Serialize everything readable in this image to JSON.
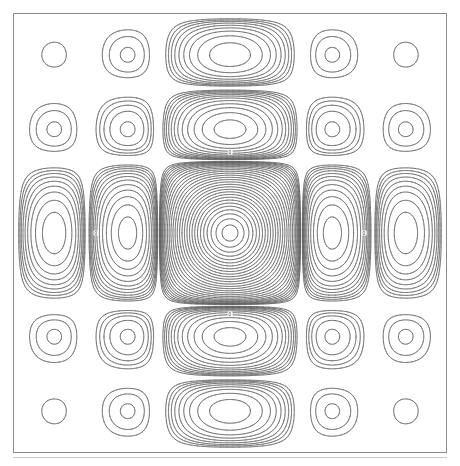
{
  "figure": {
    "title": "",
    "background_color": "#ffffff",
    "frame_color": "#8a8a8a",
    "line_color": "#555555",
    "frame": {
      "x": 13,
      "y": 13,
      "width": 434,
      "height": 440
    }
  },
  "chart_data": {
    "type": "contour",
    "title": "",
    "subtitle": "",
    "xlabel": "",
    "ylabel": "",
    "xlim": [
      -9.5,
      9.5
    ],
    "ylim": [
      -9.5,
      9.5
    ],
    "grid": false,
    "legend": false,
    "legend_position": "none",
    "axis_ticks_visible": false,
    "tick_labels_x": [],
    "tick_labels_y": [],
    "symmetry": "4-fold (mirror in x and y)",
    "center": {
      "x": 230,
      "y": 233
    },
    "function": "separable-sinc-squared",
    "function_expression": "z = (sin(x)/x)^2 * (sin(y)/y)^2",
    "peak_value": 1.0,
    "contour_levels": [
      0.0002,
      0.0004,
      0.0007,
      0.0012,
      0.002,
      0.0032,
      0.005,
      0.008,
      0.0125,
      0.019,
      0.028,
      0.04,
      0.056,
      0.076,
      0.1,
      0.13,
      0.165,
      0.205,
      0.25,
      0.3,
      0.355,
      0.415,
      0.48,
      0.55,
      0.625,
      0.705,
      0.79,
      0.88,
      0.96
    ],
    "annotations": [
      {
        "text": "0",
        "x": 96,
        "y": 233,
        "kind": "contour-label"
      },
      {
        "text": "0",
        "x": 364,
        "y": 233,
        "kind": "contour-label"
      },
      {
        "text": "0",
        "x": 230,
        "y": 152,
        "kind": "contour-label"
      },
      {
        "text": "0",
        "x": 230,
        "y": 314,
        "kind": "contour-label"
      }
    ],
    "rendering": {
      "grid_resolution": 900,
      "line_width": 0.6,
      "antialias": true
    }
  },
  "baseline": {
    "visible": true,
    "color": "#c8c8c8"
  }
}
